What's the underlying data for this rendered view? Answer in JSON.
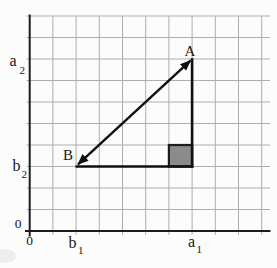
{
  "figure": {
    "labels": {
      "point_a": "A",
      "point_b": "B",
      "axis_y_upper_base": "a",
      "axis_y_upper_sub": "2",
      "axis_y_lower_base": "b",
      "axis_y_lower_sub": "2",
      "axis_y_origin": "0",
      "axis_x_origin": "0",
      "axis_x_left_base": "b",
      "axis_x_left_sub": "1",
      "axis_x_right_base": "a",
      "axis_x_right_sub": "1"
    },
    "grid": {
      "columns": 10,
      "rows": 10
    },
    "colors": {
      "background": "#fcfcfc",
      "grid_line": "#aeaeae",
      "axis": "#1c1c1c",
      "figure_line": "#0f0f0f",
      "right_angle_fill": "#8b8b8b",
      "right_angle_border": "#1c1c1c",
      "label": "#141414",
      "smudge": "#e0e0e0"
    }
  }
}
